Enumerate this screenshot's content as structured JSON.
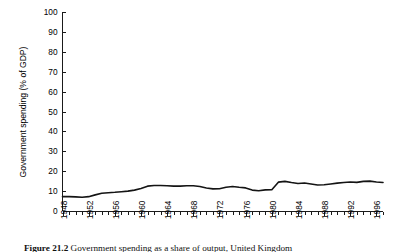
{
  "figure": {
    "caption_label": "Figure",
    "caption_number": "21.2",
    "caption_text": "Government spending as a share of output, United Kingdom"
  },
  "chart_data": {
    "type": "line",
    "title": "",
    "subtitle": "",
    "xlabel": "",
    "ylabel": "Government spending (% of GDP)",
    "ylim": [
      0,
      100
    ],
    "xlim": [
      1948,
      1997
    ],
    "yticks": [
      0,
      10,
      20,
      30,
      40,
      50,
      60,
      70,
      80,
      90,
      100
    ],
    "ytick_labels": [
      "0",
      "10",
      "20",
      "30",
      "40",
      "50",
      "60",
      "70",
      "80",
      "90",
      "100"
    ],
    "xticks": [
      1948,
      1952,
      1956,
      1960,
      1964,
      1968,
      1972,
      1976,
      1980,
      1984,
      1988,
      1992,
      1996
    ],
    "xtick_labels": [
      "1948",
      "1952",
      "1956",
      "1960",
      "1964",
      "1968",
      "1972",
      "1976",
      "1980",
      "1984",
      "1988",
      "1992",
      "1996"
    ],
    "x_minor_tick_interval": 1,
    "grid": false,
    "legend": false,
    "legend_position": "none",
    "line_color": "#141414",
    "axis_color": "#1a1a1a",
    "background_color": "#ffffff",
    "series": [
      {
        "name": "Government spending (% of GDP)",
        "x": [
          1948,
          1949,
          1950,
          1951,
          1952,
          1953,
          1954,
          1955,
          1956,
          1957,
          1958,
          1959,
          1960,
          1961,
          1962,
          1963,
          1964,
          1965,
          1966,
          1967,
          1968,
          1969,
          1970,
          1971,
          1972,
          1973,
          1974,
          1975,
          1976,
          1977,
          1978,
          1979,
          1980,
          1981,
          1982,
          1983,
          1984,
          1985,
          1986,
          1987,
          1988,
          1989,
          1990,
          1991,
          1992,
          1993,
          1994,
          1995,
          1996,
          1997
        ],
        "values": [
          7.2,
          7.2,
          7.1,
          6.9,
          7.2,
          8.1,
          8.9,
          9.2,
          9.4,
          9.7,
          10.0,
          10.5,
          11.3,
          12.5,
          12.8,
          12.8,
          12.7,
          12.5,
          12.5,
          12.7,
          12.7,
          12.3,
          11.6,
          11.1,
          11.2,
          11.9,
          12.3,
          11.9,
          11.6,
          10.5,
          10.2,
          10.6,
          10.7,
          14.5,
          14.9,
          14.3,
          13.8,
          14.1,
          13.6,
          13.1,
          13.2,
          13.6,
          14.0,
          14.3,
          14.6,
          14.4,
          14.9,
          15.0,
          14.6,
          14.3
        ]
      }
    ]
  }
}
